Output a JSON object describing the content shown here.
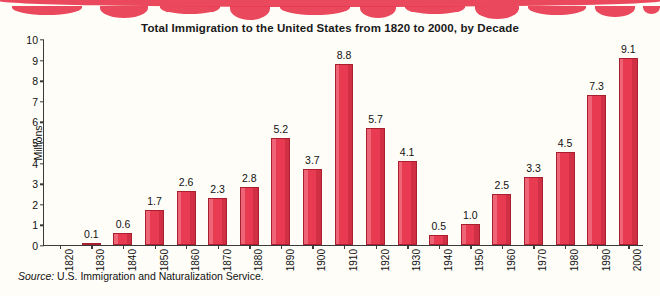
{
  "chart_data": {
    "type": "bar",
    "title": "Total Immigration to the United States from 1820 to 2000, by Decade",
    "xlabel": "",
    "ylabel": "Millions",
    "ylim": [
      0,
      10
    ],
    "yticks": [
      0,
      1,
      2,
      3,
      4,
      5,
      6,
      7,
      8,
      9,
      10
    ],
    "grid": false,
    "legend": null,
    "bar_color": "#e83a50",
    "categories": [
      "1820",
      "1830",
      "1840",
      "1850",
      "1860",
      "1870",
      "1880",
      "1890",
      "1900",
      "1910",
      "1920",
      "1930",
      "1940",
      "1950",
      "1960",
      "1970",
      "1980",
      "1990",
      "2000"
    ],
    "values": [
      0.0,
      0.1,
      0.6,
      1.7,
      2.6,
      2.3,
      2.8,
      5.2,
      3.7,
      8.8,
      5.7,
      4.1,
      0.5,
      1.0,
      2.5,
      3.3,
      4.5,
      7.3,
      9.1
    ],
    "value_labels": [
      "",
      "0.1",
      "0.6",
      "1.7",
      "2.6",
      "2.3",
      "2.8",
      "5.2",
      "3.7",
      "8.8",
      "5.7",
      "4.1",
      "0.5",
      "1.0",
      "2.5",
      "3.3",
      "4.5",
      "7.3",
      "9.1"
    ],
    "source_prefix": "Source:",
    "source_text": "U.S. Immigration and Naturalization Service."
  }
}
